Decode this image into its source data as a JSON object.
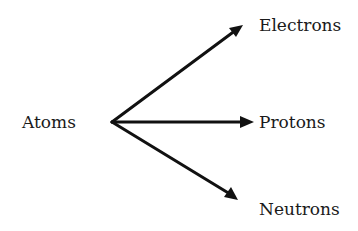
{
  "diagram": {
    "source": {
      "label": "Atoms"
    },
    "targets": [
      {
        "label": "Electrons"
      },
      {
        "label": "Protons"
      },
      {
        "label": "Neutrons"
      }
    ],
    "colors": {
      "stroke": "#111111",
      "text": "#1a1a1a",
      "background": "#ffffff"
    }
  }
}
